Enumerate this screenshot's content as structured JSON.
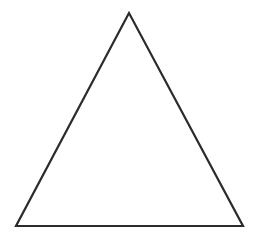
{
  "diagram": {
    "shape": "triangle",
    "kind": "equilateral-outline",
    "background": "#ffffff",
    "stroke_color": "#2b2b2b",
    "fill_color": "none",
    "stroke_width": 2.2,
    "vertices": {
      "apex": [
        129,
        13
      ],
      "bottom_left": [
        16,
        226
      ],
      "bottom_right": [
        243,
        226
      ]
    }
  }
}
